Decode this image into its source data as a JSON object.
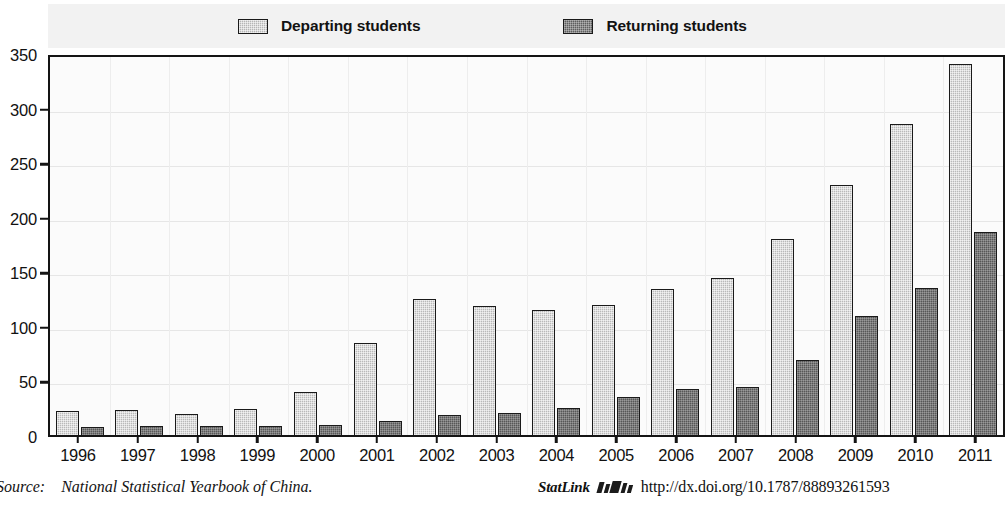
{
  "chart_data": {
    "type": "bar",
    "title": "",
    "subtitle": "",
    "xlabel": "",
    "ylabel": "",
    "ylim": [
      0,
      350
    ],
    "yticks": [
      0,
      50,
      100,
      150,
      200,
      250,
      300,
      350
    ],
    "grid": true,
    "legend_position": "top",
    "categories": [
      "1996",
      "1997",
      "1998",
      "1999",
      "2000",
      "2001",
      "2002",
      "2003",
      "2004",
      "2005",
      "2006",
      "2007",
      "2008",
      "2009",
      "2010",
      "2011"
    ],
    "series": [
      {
        "name": "Departing students",
        "color": "#b9b9b9",
        "values": [
          22,
          23,
          19,
          24,
          39,
          84,
          125,
          118,
          115,
          119,
          134,
          144,
          180,
          229,
          285,
          340
        ]
      },
      {
        "name": "Returning students",
        "color": "#575757",
        "values": [
          7,
          8,
          8,
          8,
          9,
          13,
          18,
          20,
          25,
          35,
          42,
          44,
          69,
          109,
          135,
          186
        ]
      }
    ]
  },
  "legend": {
    "entries": [
      {
        "label": "Departing students",
        "swatch": "legend-swatch-departing"
      },
      {
        "label": "Returning students",
        "swatch": "legend-swatch-returning"
      }
    ]
  },
  "footer": {
    "source_prefix": "Source:",
    "source_text": "National Statistical Yearbook of China.",
    "statlink_label": "StatLink",
    "statlink_url": "http://dx.doi.org/10.1787/88893261593"
  },
  "colors": {
    "departing": "#b9b9b9",
    "returning": "#575757",
    "axis": "#141414",
    "plot_background": "#fbfbfb",
    "legend_background": "#f2f2f2"
  }
}
